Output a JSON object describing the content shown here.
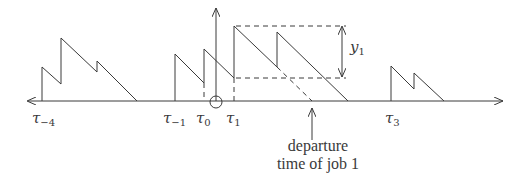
{
  "diagram": {
    "type": "workload-sawtooth-timeline",
    "colors": {
      "ink": "#3a3a3a",
      "background": "#ffffff"
    },
    "axis": {
      "y": 101,
      "x_start": 27,
      "x_end": 503,
      "direction_left_arrow": true,
      "direction_right_arrow": true
    },
    "vertical_axis": {
      "x": 216,
      "y_top": 8,
      "y_bottom": 101
    },
    "origin_circle": {
      "cx": 216,
      "cy": 102,
      "r": 6
    },
    "labels": {
      "tau_m4": {
        "base": "τ",
        "sub": "−4"
      },
      "tau_m1": {
        "base": "τ",
        "sub": "−1"
      },
      "tau_0": {
        "base": "τ",
        "sub": "0"
      },
      "tau_1": {
        "base": "τ",
        "sub": "1"
      },
      "tau_3": {
        "base": "τ",
        "sub": "3"
      },
      "y_1": {
        "base": "y",
        "sub": "1"
      }
    },
    "caption": {
      "line1": "departure",
      "line2": "time of job 1"
    }
  }
}
